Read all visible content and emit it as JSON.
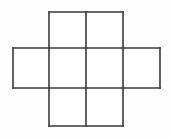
{
  "figure": {
    "background_color": "#fdfdfd",
    "line_color": "#3a3a3a",
    "fill_color": "#ffffff",
    "stroke_width": 1.6,
    "canvas": {
      "width": 171,
      "height": 139
    },
    "grid": {
      "columns": 4,
      "rows": 3,
      "x_positions": [
        13,
        49,
        86,
        123,
        160
      ],
      "y_positions": [
        12,
        48,
        88,
        126
      ],
      "column_widths": [
        36,
        37,
        37,
        37
      ],
      "row_heights": [
        36,
        40,
        38
      ]
    },
    "cells": [
      {
        "name": "top-left-cell",
        "col": 1,
        "row": 0,
        "x": 49,
        "y": 12,
        "width": 37,
        "height": 36
      },
      {
        "name": "top-right-cell",
        "col": 2,
        "row": 0,
        "x": 86,
        "y": 12,
        "width": 37,
        "height": 36
      },
      {
        "name": "middle-far-left-cell",
        "col": 0,
        "row": 1,
        "x": 13,
        "y": 48,
        "width": 36,
        "height": 40
      },
      {
        "name": "middle-left-cell",
        "col": 1,
        "row": 1,
        "x": 49,
        "y": 48,
        "width": 37,
        "height": 40
      },
      {
        "name": "middle-right-cell",
        "col": 2,
        "row": 1,
        "x": 86,
        "y": 48,
        "width": 37,
        "height": 40
      },
      {
        "name": "middle-far-right-cell",
        "col": 3,
        "row": 1,
        "x": 123,
        "y": 48,
        "width": 37,
        "height": 40
      },
      {
        "name": "bottom-left-cell",
        "col": 1,
        "row": 2,
        "x": 49,
        "y": 88,
        "width": 37,
        "height": 38
      },
      {
        "name": "bottom-right-cell",
        "col": 2,
        "row": 2,
        "x": 86,
        "y": 88,
        "width": 37,
        "height": 38
      }
    ],
    "segments": [
      {
        "name": "top-edge",
        "x1": 49,
        "y1": 12,
        "x2": 123,
        "y2": 12
      },
      {
        "name": "upper-left-vertical",
        "x1": 49,
        "y1": 12,
        "x2": 49,
        "y2": 48
      },
      {
        "name": "upper-center-vertical",
        "x1": 86,
        "y1": 12,
        "x2": 86,
        "y2": 48
      },
      {
        "name": "upper-right-vertical",
        "x1": 123,
        "y1": 12,
        "x2": 123,
        "y2": 48
      },
      {
        "name": "upper-horizontal-left",
        "x1": 13,
        "y1": 48,
        "x2": 49,
        "y2": 48
      },
      {
        "name": "upper-horizontal-middle",
        "x1": 49,
        "y1": 48,
        "x2": 123,
        "y2": 48
      },
      {
        "name": "upper-horizontal-right",
        "x1": 123,
        "y1": 48,
        "x2": 160,
        "y2": 48
      },
      {
        "name": "far-left-vertical",
        "x1": 13,
        "y1": 48,
        "x2": 13,
        "y2": 88
      },
      {
        "name": "middle-left-vertical",
        "x1": 49,
        "y1": 48,
        "x2": 49,
        "y2": 88
      },
      {
        "name": "middle-center-vertical",
        "x1": 86,
        "y1": 48,
        "x2": 86,
        "y2": 88
      },
      {
        "name": "middle-right-vertical",
        "x1": 123,
        "y1": 48,
        "x2": 123,
        "y2": 88
      },
      {
        "name": "far-right-vertical",
        "x1": 160,
        "y1": 48,
        "x2": 160,
        "y2": 88
      },
      {
        "name": "lower-horizontal-left",
        "x1": 13,
        "y1": 88,
        "x2": 49,
        "y2": 88
      },
      {
        "name": "lower-horizontal-middle",
        "x1": 49,
        "y1": 88,
        "x2": 123,
        "y2": 88
      },
      {
        "name": "lower-horizontal-right",
        "x1": 123,
        "y1": 88,
        "x2": 160,
        "y2": 88
      },
      {
        "name": "bottom-left-vertical",
        "x1": 49,
        "y1": 88,
        "x2": 49,
        "y2": 126
      },
      {
        "name": "bottom-center-vertical",
        "x1": 86,
        "y1": 88,
        "x2": 86,
        "y2": 126
      },
      {
        "name": "bottom-right-vertical",
        "x1": 123,
        "y1": 88,
        "x2": 123,
        "y2": 126
      },
      {
        "name": "bottom-edge",
        "x1": 49,
        "y1": 126,
        "x2": 123,
        "y2": 126
      }
    ]
  }
}
